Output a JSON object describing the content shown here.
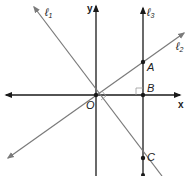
{
  "diagram": {
    "axes": {
      "x_label": "x",
      "y_label": "y",
      "origin_label": "O"
    },
    "lines": [
      {
        "id": "l1",
        "label": "ℓ",
        "sub": "1"
      },
      {
        "id": "l2",
        "label": "ℓ",
        "sub": "2"
      },
      {
        "id": "l3",
        "label": "ℓ",
        "sub": "3"
      }
    ],
    "points": [
      {
        "label": "A"
      },
      {
        "label": "B"
      },
      {
        "label": "C"
      }
    ],
    "colors": {
      "axis": "#1a1a1a",
      "line": "#7a7a7a",
      "right_angle": "#999999"
    }
  }
}
